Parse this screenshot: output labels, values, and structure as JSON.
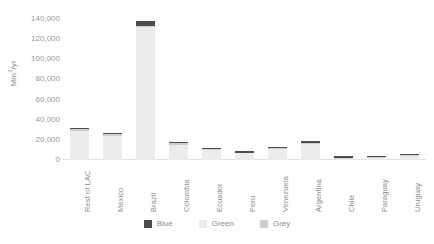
{
  "chart_data": {
    "type": "bar",
    "subtype": "stacked-bar",
    "title": "",
    "xlabel": "",
    "ylabel": "Mm3/yr",
    "ylabel_display": "Mm³/yr",
    "ylim": [
      0,
      140000
    ],
    "ytick_step": 20000,
    "grid": false,
    "legend_position": "bottom-center",
    "categories": [
      "Rest of LAC",
      "Mexico",
      "Brazil",
      "Colombia",
      "Ecuador",
      "Peru",
      "Venezuela",
      "Argentina",
      "Chile",
      "Paraguay",
      "Uruguay"
    ],
    "ytick_labels": [
      "140,000",
      "120,000",
      "100,000",
      "80,000",
      "60,000",
      "40,000",
      "20,000",
      "0"
    ],
    "ytick_values": [
      140000,
      120000,
      100000,
      80000,
      60000,
      40000,
      20000,
      0
    ],
    "series": [
      {
        "name": "Green",
        "color": "#ececec",
        "values": [
          29000,
          24000,
          132000,
          15000,
          10000,
          6500,
          10500,
          15500,
          500,
          2000,
          3500
        ]
      },
      {
        "name": "Grey",
        "color": "#cfcfcf",
        "values": [
          1500,
          1500,
          1000,
          1500,
          1000,
          800,
          1200,
          1500,
          300,
          1200,
          1200
        ]
      },
      {
        "name": "Blue",
        "color": "#4d4d4d",
        "values": [
          1500,
          1500,
          5000,
          1000,
          800,
          1200,
          1000,
          2000,
          2500,
          600,
          1000
        ]
      }
    ],
    "totals": [
      32000,
      27000,
      138000,
      17500,
      11800,
      8500,
      12700,
      19000,
      3300,
      3800,
      5700
    ]
  },
  "legend": {
    "items": [
      {
        "label": "Blue",
        "color": "#4d4d4d"
      },
      {
        "label": "Green",
        "color": "#ececec"
      },
      {
        "label": "Grey",
        "color": "#cfcfcf"
      }
    ]
  },
  "colors": {
    "blue": "#4d4d4d",
    "green": "#ececec",
    "grey": "#cfcfcf",
    "axis": "#e2e2e2",
    "text": "#8d8d8d",
    "background": "#ffffff"
  }
}
